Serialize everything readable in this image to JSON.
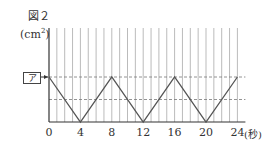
{
  "figure": {
    "label": "図２",
    "y_unit": "(cm",
    "y_unit_sup": "2",
    "y_unit_close": ")",
    "x_unit": "(秒)",
    "marker_label": "ア"
  },
  "chart_data": {
    "type": "line",
    "title": "図２",
    "xlabel": "(秒)",
    "ylabel": "(cm²)",
    "x_ticks": [
      0,
      4,
      8,
      12,
      16,
      20,
      24
    ],
    "x": [
      0,
      4,
      8,
      12,
      16,
      20,
      24
    ],
    "series": [
      {
        "name": "area",
        "values": [
          "ア",
          0,
          "ア",
          0,
          "ア",
          0,
          "ア"
        ]
      }
    ],
    "y_marker": "ア",
    "grid": {
      "vertical_every_seconds": 1,
      "horizontal_dashed": [
        "ア",
        "ア/2"
      ]
    },
    "xlim": [
      0,
      24
    ]
  },
  "colors": {
    "line": "#555555",
    "grid": "#bbbbbb",
    "dash": "#777777"
  }
}
